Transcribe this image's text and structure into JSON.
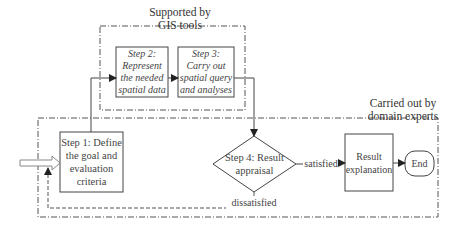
{
  "diagram": {
    "groups": [
      {
        "id": "gis",
        "label_line1": "Supported by",
        "label_line2": "GIS tools"
      },
      {
        "id": "experts",
        "label_line1": "Carried out by",
        "label_line2": "domain experts"
      }
    ],
    "nodes": {
      "step1": {
        "lines": [
          "Step 1: Define",
          "the goal and",
          "evaluation",
          "criteria"
        ]
      },
      "step2": {
        "lines": [
          "Step 2:",
          "Represent",
          "the needed",
          "spatial data"
        ]
      },
      "step3": {
        "lines": [
          "Step 3:",
          "Carry out",
          "spatial query",
          "and analyses"
        ]
      },
      "step4": {
        "lines": [
          "Step 4: Result",
          "appraisal"
        ]
      },
      "result": {
        "lines": [
          "Result",
          "explanation"
        ]
      },
      "end": {
        "label": "End"
      }
    },
    "edges": {
      "satisfied": "satisfied",
      "dissatisfied": "dissatisfied"
    },
    "colors": {
      "line": "#444444",
      "dashed": "#555555",
      "input_arrow": "#888888"
    }
  }
}
